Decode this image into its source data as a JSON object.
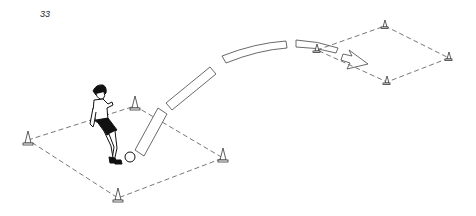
{
  "page": {
    "number": "33"
  },
  "illustration": {
    "subject": "soccer long pass drill",
    "elements": {
      "player": "player-kicking-ball",
      "ball": "soccer-ball",
      "trajectory": "curved-segmented-arrow",
      "start_grid": "left-dashed-square-with-4-cones",
      "target_grid": "right-dashed-square-with-4-cones"
    },
    "colors": {
      "ink": "#111111",
      "lines": "#555555",
      "background": "#ffffff"
    }
  }
}
